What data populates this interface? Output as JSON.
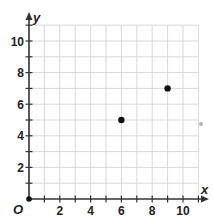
{
  "chart_data": {
    "type": "scatter",
    "title": "",
    "xlabel": "x",
    "ylabel": "y",
    "origin_label": "O",
    "xlim": [
      0,
      11
    ],
    "ylim": [
      0,
      11
    ],
    "grid": true,
    "x_ticks": [
      2,
      4,
      6,
      8,
      10
    ],
    "y_ticks": [
      2,
      4,
      6,
      8,
      10
    ],
    "series": [
      {
        "name": "points",
        "points": [
          {
            "x": 0,
            "y": 0
          },
          {
            "x": 6,
            "y": 5
          },
          {
            "x": 9,
            "y": 7
          }
        ]
      }
    ],
    "colors": {
      "grid": "#cfcfcf",
      "axis": "#333333",
      "point": "#111111",
      "stray_dot": "#b0b0b0"
    }
  }
}
